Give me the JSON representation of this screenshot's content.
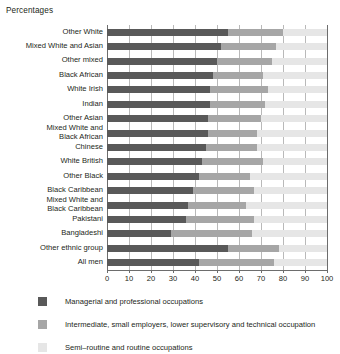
{
  "chart_data": {
    "type": "bar",
    "orientation": "horizontal",
    "stacked": true,
    "title": "Percentages",
    "xlabel": "",
    "ylabel": "",
    "xlim": [
      0,
      100
    ],
    "xticks": [
      0,
      10,
      20,
      30,
      40,
      50,
      60,
      70,
      80,
      90,
      100
    ],
    "xticklabels": [
      "0",
      "10",
      "20",
      "30",
      "40",
      "50",
      "60",
      "70",
      "80",
      "90",
      "100"
    ],
    "grid": true,
    "legend_position": "bottom",
    "categories": [
      "Other White",
      "Mixed White and Asian",
      "Other mixed",
      "Black African",
      "White Irish",
      "Indian",
      "Other Asian",
      "Mixed White and\nBlack African",
      "Chinese",
      "White British",
      "Other Black",
      "Black Caribbean",
      "Mixed White and\nBlack Caribbean",
      "Pakistani",
      "Bangladeshi",
      "Other ethnic group",
      "All men"
    ],
    "series": [
      {
        "name": "Managerial and professional occupations",
        "color": "#595959",
        "values": [
          55,
          52,
          50,
          48,
          47,
          47,
          46,
          46,
          45,
          43,
          42,
          39,
          37,
          36,
          29,
          55,
          42
        ]
      },
      {
        "name": "Intermediate, small employers, lower supervisory and technical occupation",
        "color": "#a6a6a6",
        "values": [
          25,
          25,
          25,
          23,
          26,
          25,
          24,
          22,
          23,
          28,
          23,
          28,
          26,
          31,
          37,
          23,
          34
        ]
      },
      {
        "name": "Semi-routine and routine occupations",
        "color": "#e6e6e6",
        "values": [
          20,
          23,
          25,
          29,
          27,
          28,
          30,
          32,
          32,
          29,
          35,
          33,
          37,
          33,
          34,
          22,
          24
        ]
      }
    ]
  },
  "legend": {
    "items": [
      {
        "label": "Managerial and professional occupations",
        "swatch": "s1"
      },
      {
        "label": "Intermediate, small employers, lower supervisory and technical occupation",
        "swatch": "s2"
      },
      {
        "label": "Semi–routine and routine occupations",
        "swatch": "s3"
      }
    ]
  }
}
